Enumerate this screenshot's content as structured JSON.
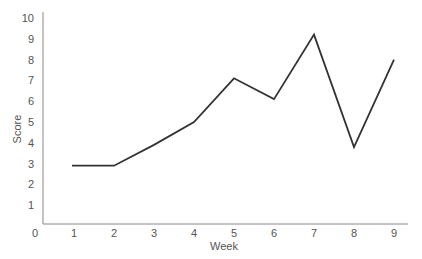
{
  "chart_data": {
    "type": "line",
    "title": "",
    "xlabel": "Week",
    "ylabel": "Score",
    "x": [
      1,
      2,
      3,
      4,
      5,
      6,
      7,
      8,
      9
    ],
    "series": [
      {
        "name": "Score",
        "values": [
          2.9,
          2.9,
          3.9,
          5.0,
          7.1,
          6.1,
          9.2,
          3.8,
          8.0
        ],
        "color": "#333333"
      }
    ],
    "xticks": [
      "0",
      "1",
      "2",
      "3",
      "4",
      "5",
      "6",
      "7",
      "8",
      "9"
    ],
    "yticks": [
      "1",
      "2",
      "3",
      "4",
      "5",
      "6",
      "7",
      "8",
      "9",
      "10"
    ],
    "xlim": [
      0,
      9.3
    ],
    "ylim": [
      0,
      10
    ],
    "grid": false,
    "legend": null
  }
}
